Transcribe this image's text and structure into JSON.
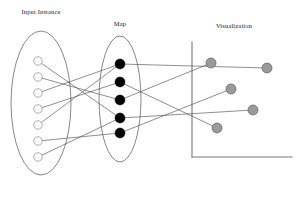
{
  "figure": {
    "title": "",
    "width": 307,
    "height": 215,
    "background_color": "#ffffff"
  },
  "labels": {
    "input_instance": "Input Instance",
    "map": "Map",
    "visualization": "Visualization"
  },
  "label_positions": {
    "input_instance": {
      "x": 41,
      "y": 14
    },
    "map": {
      "x": 120,
      "y": 26
    },
    "visualization": {
      "x": 234,
      "y": 28
    }
  },
  "colors": {
    "input_node_fill": "#ffffff",
    "input_node_stroke": "#888888",
    "map_node_fill": "#000000",
    "vis_node_fill": "#9a9a9a",
    "vis_node_stroke": "#5f5f5f",
    "edge": "#444444",
    "ellipse_stroke": "#555555",
    "axis": "#777777",
    "text": "#1a1a1a"
  },
  "groups": [
    {
      "name": "input-instance-ellipse",
      "cx": 41,
      "cy": 103,
      "rx": 30,
      "ry": 72
    },
    {
      "name": "map-ellipse",
      "cx": 120,
      "cy": 99,
      "rx": 21,
      "ry": 63
    }
  ],
  "axes": {
    "name": "visualization-axes",
    "vertical": {
      "x": 192,
      "y1": 42,
      "y2": 157
    },
    "horizontal": {
      "y": 157,
      "x1": 192,
      "x2": 292
    }
  },
  "nodes": {
    "input": [
      {
        "id": "i1",
        "cx": 38,
        "cy": 61,
        "r": 4.2
      },
      {
        "id": "i2",
        "cx": 38,
        "cy": 77,
        "r": 4.2
      },
      {
        "id": "i3",
        "cx": 38,
        "cy": 93,
        "r": 4.2
      },
      {
        "id": "i4",
        "cx": 38,
        "cy": 109,
        "r": 4.2
      },
      {
        "id": "i5",
        "cx": 38,
        "cy": 125,
        "r": 4.2
      },
      {
        "id": "i6",
        "cx": 38,
        "cy": 141,
        "r": 4.2
      },
      {
        "id": "i7",
        "cx": 38,
        "cy": 157,
        "r": 4.2
      }
    ],
    "map": [
      {
        "id": "m1",
        "cx": 120,
        "cy": 64,
        "r": 5.0
      },
      {
        "id": "m2",
        "cx": 120,
        "cy": 82,
        "r": 5.0
      },
      {
        "id": "m3",
        "cx": 120,
        "cy": 100,
        "r": 5.0
      },
      {
        "id": "m4",
        "cx": 120,
        "cy": 118,
        "r": 5.0
      },
      {
        "id": "m5",
        "cx": 120,
        "cy": 133,
        "r": 5.0
      }
    ],
    "visualization": [
      {
        "id": "v1",
        "cx": 211,
        "cy": 63,
        "r": 5.0
      },
      {
        "id": "v2",
        "cx": 267,
        "cy": 68,
        "r": 5.0
      },
      {
        "id": "v3",
        "cx": 231,
        "cy": 89,
        "r": 5.0
      },
      {
        "id": "v4",
        "cx": 253,
        "cy": 110,
        "r": 5.0
      },
      {
        "id": "v5",
        "cx": 217,
        "cy": 128,
        "r": 5.0
      }
    ]
  },
  "edges": {
    "input_to_map": [
      {
        "from": "i1",
        "to": "m4"
      },
      {
        "from": "i2",
        "to": "m3"
      },
      {
        "from": "i3",
        "to": "m1"
      },
      {
        "from": "i4",
        "to": "m2"
      },
      {
        "from": "i5",
        "to": "m1"
      },
      {
        "from": "i6",
        "to": "m5"
      },
      {
        "from": "i7",
        "to": "m4"
      }
    ],
    "map_to_visualization": [
      {
        "from": "m1",
        "to": "v2"
      },
      {
        "from": "m2",
        "to": "v5"
      },
      {
        "from": "m3",
        "to": "v1"
      },
      {
        "from": "m4",
        "to": "v4"
      },
      {
        "from": "m5",
        "to": "v3"
      }
    ]
  }
}
